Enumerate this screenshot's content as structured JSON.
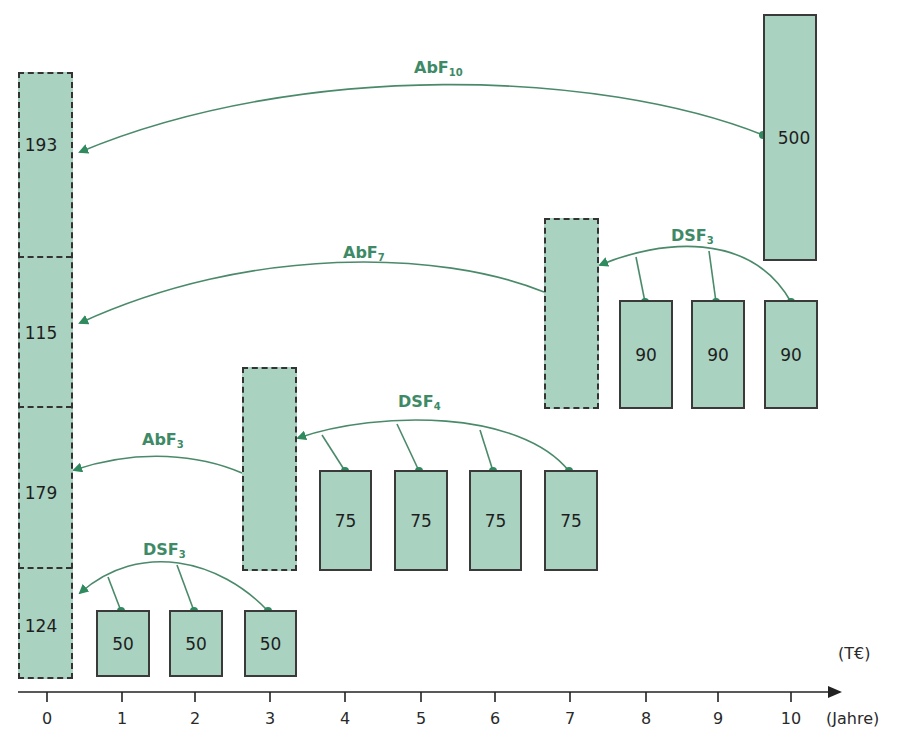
{
  "diagram": {
    "units": {
      "value": "(T€)",
      "axis": "(Jahre)"
    },
    "axis": {
      "ticks": [
        "0",
        "1",
        "2",
        "3",
        "4",
        "5",
        "6",
        "7",
        "8",
        "9",
        "10"
      ]
    },
    "left_stack": {
      "segments": [
        {
          "value": "193",
          "factor": "AbF",
          "factor_sub": "10"
        },
        {
          "value": "115",
          "factor": "AbF",
          "factor_sub": "7"
        },
        {
          "value": "179",
          "factor": "AbF",
          "factor_sub": "3"
        },
        {
          "value": "124",
          "factor": "DSF",
          "factor_sub": "3"
        }
      ]
    },
    "payment_500": {
      "year": "10",
      "value": "500"
    },
    "group_90": {
      "years": [
        "8",
        "9",
        "10"
      ],
      "values": [
        "90",
        "90",
        "90"
      ],
      "factor": "DSF",
      "factor_sub": "3",
      "target_year": "7"
    },
    "group_75": {
      "years": [
        "4",
        "5",
        "6",
        "7"
      ],
      "values": [
        "75",
        "75",
        "75",
        "75"
      ],
      "factor": "DSF",
      "factor_sub": "4",
      "target_year": "3"
    },
    "group_50": {
      "years": [
        "1",
        "2",
        "3"
      ],
      "values": [
        "50",
        "50",
        "50"
      ],
      "factor": "DSF",
      "factor_sub": "3",
      "target_year": "0"
    },
    "colors": {
      "fill": "#a9d2c0",
      "arrow": "#3e8a67",
      "border": "#3a3a3a"
    }
  }
}
